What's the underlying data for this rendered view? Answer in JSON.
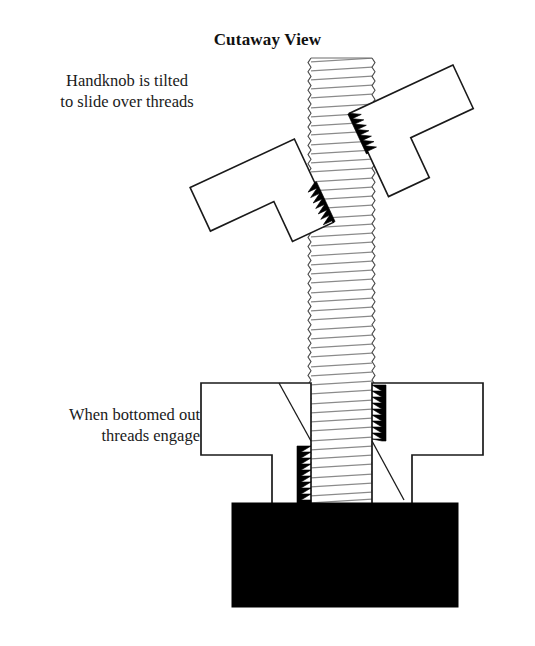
{
  "figure": {
    "title": "Cutaway View",
    "annotations": {
      "tilted": "Handknob is tilted\nto slide over threads",
      "bottomed": "When bottomed out\nthreads engage"
    }
  },
  "colors": {
    "outline": "#1a1a1a",
    "thread_line": "#7a7a7a",
    "engaged_thread": "#000000",
    "base_block": "#000000",
    "background": "#ffffff"
  },
  "geometry": {
    "rod": {
      "left": 311,
      "right": 372,
      "top": 58,
      "bottom": 504,
      "thread_pitch": 9.2,
      "thread_slant": 4
    },
    "tilted_handknob": {
      "rotation_deg": -25,
      "pivot_x": 341,
      "pivot_y": 168,
      "engaged_thread_side": "inner-tip"
    },
    "bottomed_handknob": {
      "flange_left": 201,
      "flange_right": 483,
      "flange_top": 383,
      "flange_bottom": 455,
      "hub_left": 272,
      "hub_right": 412,
      "hub_bottom": 504
    },
    "base_block": {
      "left": 232,
      "top": 503,
      "right": 458,
      "bottom": 607
    }
  }
}
